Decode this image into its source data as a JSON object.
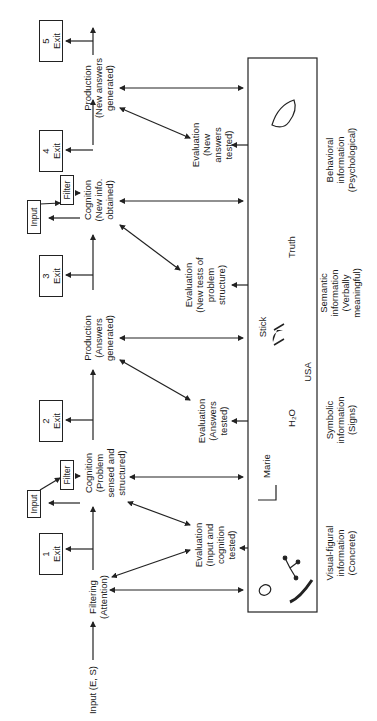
{
  "diagram": {
    "orientation": "rotated-90-ccw",
    "input_label": "Input (E, S)",
    "stages": [
      {
        "id": "filtering",
        "label": "Filtering",
        "sub": "(Attention)"
      },
      {
        "id": "cognition1",
        "label": "Cognition",
        "sub": "(Problem sensed and structured)"
      },
      {
        "id": "production1",
        "label": "Production",
        "sub": "(Answers generated)"
      },
      {
        "id": "cognition2",
        "label": "Cognition",
        "sub": "(New info. obtained)"
      },
      {
        "id": "production2",
        "label": "Production",
        "sub": "(New answers generated)"
      }
    ],
    "evaluations": [
      {
        "label": "Evaluation",
        "sub": "(Input and cognition tested)"
      },
      {
        "label": "Evaluation",
        "sub": "(Answers tested)"
      },
      {
        "label": "Evaluation",
        "sub": "(New tests of problem structure)"
      },
      {
        "label": "Evaluation",
        "sub": "(New answers tested)"
      }
    ],
    "exits": [
      {
        "num": "1",
        "label": "Exit"
      },
      {
        "num": "2",
        "label": "Exit"
      },
      {
        "num": "3",
        "label": "Exit"
      },
      {
        "num": "4",
        "label": "Exit"
      },
      {
        "num": "5",
        "label": "Exit"
      }
    ],
    "input_boxes": [
      "Input",
      "Input"
    ],
    "filter_boxes": [
      "Filter",
      "Filter"
    ],
    "memory_items": [
      "Marie",
      "H₂O",
      "USA",
      "Stick",
      "Truth"
    ],
    "information_types": [
      {
        "label": "Visual-figural",
        "l2": "information",
        "l3": "(Concrete)"
      },
      {
        "label": "Symbolic",
        "l2": "information",
        "l3": "(Signs)"
      },
      {
        "label": "Semantic",
        "l2": "information",
        "l3": "(Verbally meaningful)"
      },
      {
        "label": "Behavioral",
        "l2": "information",
        "l3": "(Psychological)"
      }
    ]
  }
}
